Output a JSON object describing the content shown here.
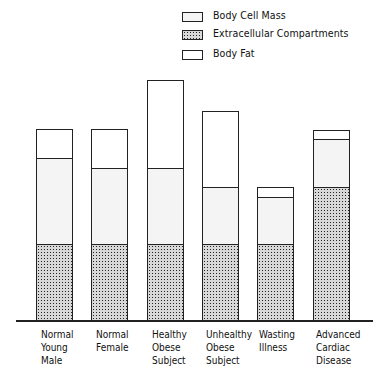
{
  "chart_data": {
    "type": "bar",
    "stacked": true,
    "title": "",
    "xlabel": "",
    "ylabel": "",
    "y_axis_shown": false,
    "grid": false,
    "legend_position": "top-right",
    "units": "relative (no y-axis scale shown)",
    "categories": [
      "Normal Young Male",
      "Normal Female",
      "Healthy Obese Subject",
      "Unhealthy Obese Subject",
      "Wasting Illness",
      "Advanced Cardiac Disease"
    ],
    "series": [
      {
        "name": "Extracellular Compartments",
        "pattern": "dense dark dots",
        "values": [
          76,
          76,
          76,
          76,
          76,
          133
        ]
      },
      {
        "name": "Body Cell Mass",
        "pattern": "light fine dots",
        "values": [
          86,
          76,
          76,
          57,
          47,
          48
        ]
      },
      {
        "name": "Body Fat",
        "pattern": "white (blank)",
        "values": [
          29,
          39,
          88,
          76,
          10,
          9
        ]
      }
    ],
    "totals": [
      191,
      191,
      240,
      209,
      133,
      190
    ]
  },
  "legend": {
    "items": [
      {
        "label": "Body Cell Mass",
        "pattern": "pat-bcm"
      },
      {
        "label": "Extracellular Compartments",
        "pattern": "pat-ecm"
      },
      {
        "label": "Body Fat",
        "pattern": "pat-fat"
      }
    ]
  },
  "x_labels": [
    "Normal\nYoung\nMale",
    "Normal\nFemale",
    "Healthy\nObese\nSubject",
    "Unhealthy\nObese\nSubject",
    "Wasting\nIllness",
    "Advanced\nCardiac\nDisease"
  ],
  "colors": {
    "outline": "#222222",
    "body_fat": "#ffffff",
    "body_cell_mass": "#ebebeb",
    "extracellular": "#555555"
  }
}
